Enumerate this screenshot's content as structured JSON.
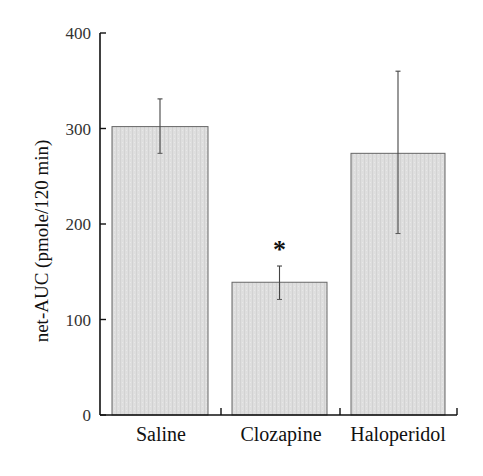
{
  "chart_data": {
    "type": "bar",
    "title": "",
    "xlabel": "",
    "ylabel": "net-AUC (pmole/120 min)",
    "ylim": [
      0,
      400
    ],
    "yticks": [
      0,
      100,
      200,
      300,
      400
    ],
    "grid": false,
    "legend": null,
    "categories": [
      "Saline",
      "Clozapine",
      "Haloperidol"
    ],
    "values": [
      302,
      139,
      274
    ],
    "error_upper": [
      331,
      156,
      360
    ],
    "error_lower": [
      274,
      121,
      190
    ],
    "annotations": [
      {
        "category": "Clozapine",
        "text": "*",
        "meaning": "significant difference"
      }
    ],
    "bar_color": "#dcdcdc",
    "edge_color": "#555555"
  },
  "axis": {
    "ylabel": "net-AUC (pmole/120 min)",
    "yticks": [
      "0",
      "100",
      "200",
      "300",
      "400"
    ]
  },
  "bars": [
    {
      "label": "Saline",
      "value": 302,
      "err_hi": 331,
      "err_lo": 274
    },
    {
      "label": "Clozapine",
      "value": 139,
      "err_hi": 156,
      "err_lo": 121,
      "mark": "*"
    },
    {
      "label": "Haloperidol",
      "value": 274,
      "err_hi": 360,
      "err_lo": 190
    }
  ]
}
